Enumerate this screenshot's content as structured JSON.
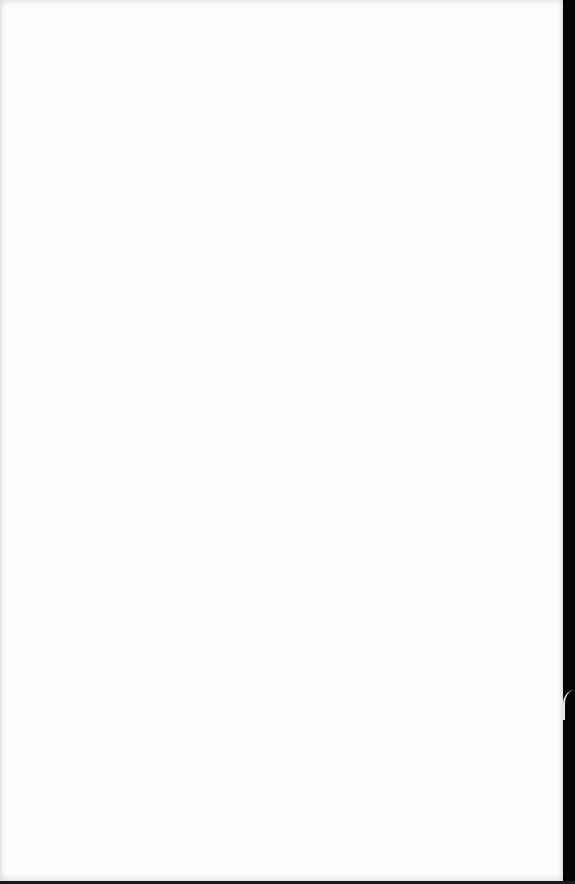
{
  "document": {
    "type": "scanned-page",
    "content": "",
    "colors": {
      "paper": "#fdfdfd",
      "edge": "#050505"
    }
  }
}
